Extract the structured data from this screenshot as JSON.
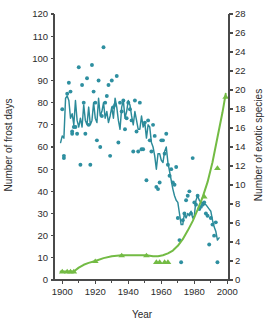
{
  "figure": {
    "background": "#ffffff",
    "width": 268,
    "height": 325
  },
  "axes": {
    "x": {
      "label": "Year",
      "min": 1895,
      "max": 2001,
      "major_ticks": [
        1900,
        1920,
        1940,
        1960,
        1980,
        2000
      ],
      "minor_ticks": [
        1910,
        1930,
        1950,
        1970,
        1990
      ],
      "ticklabels": [
        "1900",
        "1920",
        "1940",
        "1960",
        "1980",
        "2000"
      ]
    },
    "y_left": {
      "label": "Number of frost days",
      "min": 0,
      "max": 120,
      "ticks": [
        0,
        10,
        20,
        30,
        40,
        50,
        60,
        70,
        80,
        90,
        100,
        110,
        120
      ],
      "ticklabels": [
        "0",
        "10",
        "20",
        "30",
        "40",
        "50",
        "60",
        "70",
        "80",
        "90",
        "100",
        "110",
        "120"
      ],
      "color": "#2b2b2b"
    },
    "y_right": {
      "label": "Number of exotic species",
      "min": 0,
      "max": 28,
      "ticks": [
        0,
        2,
        4,
        6,
        8,
        10,
        12,
        14,
        16,
        18,
        20,
        22,
        24,
        26,
        28
      ],
      "ticklabels": [
        "0",
        "2",
        "4",
        "6",
        "8",
        "10",
        "12",
        "14",
        "16",
        "18",
        "20",
        "22",
        "24",
        "26",
        "28"
      ],
      "color": "#2b2b2b"
    }
  },
  "colors": {
    "frost": "#2b8a99",
    "frost_dot": "#2e8fa0",
    "exotic": "#73bb44",
    "axis": "#4a4a4a",
    "text": "#2b2b2b"
  },
  "chart_data": {
    "type": "line",
    "title": "",
    "xlabel": "Year",
    "ylabel": "Number of frost days",
    "y2label": "Number of exotic species",
    "xlim": [
      1895,
      2001
    ],
    "ylim": [
      0,
      120
    ],
    "y2lim": [
      0,
      28
    ],
    "grid": false,
    "legend": "none",
    "series": [
      {
        "name": "Annual number of frost days",
        "type": "scatter",
        "axis": "left",
        "color": "#2e8fa0",
        "marker": "circle",
        "points": [
          [
            1900,
            77
          ],
          [
            1901,
            56
          ],
          [
            1901,
            55
          ],
          [
            1903,
            84
          ],
          [
            1904,
            89
          ],
          [
            1905,
            85
          ],
          [
            1906,
            67
          ],
          [
            1906,
            66
          ],
          [
            1907,
            69
          ],
          [
            1908,
            69
          ],
          [
            1909,
            66
          ],
          [
            1910,
            96
          ],
          [
            1911,
            52
          ],
          [
            1912,
            88
          ],
          [
            1913,
            80
          ],
          [
            1914,
            66
          ],
          [
            1915,
            91
          ],
          [
            1916,
            70
          ],
          [
            1917,
            52
          ],
          [
            1918,
            97
          ],
          [
            1919,
            85
          ],
          [
            1920,
            80
          ],
          [
            1921,
            63
          ],
          [
            1922,
            90
          ],
          [
            1923,
            60
          ],
          [
            1924,
            74
          ],
          [
            1925,
            105
          ],
          [
            1926,
            80
          ],
          [
            1927,
            83
          ],
          [
            1928,
            88
          ],
          [
            1929,
            56
          ],
          [
            1930,
            90
          ],
          [
            1931,
            78
          ],
          [
            1932,
            79
          ],
          [
            1933,
            92
          ],
          [
            1934,
            62
          ],
          [
            1935,
            80
          ],
          [
            1936,
            76
          ],
          [
            1937,
            81
          ],
          [
            1938,
            68
          ],
          [
            1939,
            73
          ],
          [
            1940,
            80
          ],
          [
            1941,
            77
          ],
          [
            1942,
            72
          ],
          [
            1943,
            58
          ],
          [
            1944,
            81
          ],
          [
            1945,
            67
          ],
          [
            1946,
            58
          ],
          [
            1947,
            80
          ],
          [
            1948,
            59
          ],
          [
            1949,
            59
          ],
          [
            1950,
            71
          ],
          [
            1951,
            45
          ],
          [
            1952,
            72
          ],
          [
            1953,
            63
          ],
          [
            1954,
            58
          ],
          [
            1955,
            70
          ],
          [
            1956,
            65
          ],
          [
            1957,
            42
          ],
          [
            1958,
            41
          ],
          [
            1959,
            44
          ],
          [
            1960,
            63
          ],
          [
            1961,
            63
          ],
          [
            1962,
            57
          ],
          [
            1963,
            66
          ],
          [
            1964,
            52
          ],
          [
            1965,
            47
          ],
          [
            1966,
            50
          ],
          [
            1967,
            44
          ],
          [
            1968,
            43
          ],
          [
            1969,
            51
          ],
          [
            1970,
            28
          ],
          [
            1971,
            18
          ],
          [
            1972,
            8
          ],
          [
            1973,
            27
          ],
          [
            1974,
            30
          ],
          [
            1975,
            36
          ],
          [
            1976,
            38
          ],
          [
            1977,
            40
          ],
          [
            1978,
            30
          ],
          [
            1979,
            55
          ],
          [
            1980,
            35
          ],
          [
            1981,
            34
          ],
          [
            1982,
            38
          ],
          [
            1983,
            32
          ],
          [
            1984,
            33
          ],
          [
            1985,
            34
          ],
          [
            1986,
            35
          ],
          [
            1987,
            30
          ],
          [
            1988,
            29
          ],
          [
            1989,
            16
          ],
          [
            1990,
            28
          ],
          [
            1991,
            25
          ],
          [
            1992,
            20
          ],
          [
            1993,
            26
          ],
          [
            1994,
            8
          ]
        ]
      },
      {
        "name": "Frost days smoothed trend",
        "type": "line",
        "axis": "left",
        "color": "#2b8a99",
        "points": [
          [
            1899,
            62
          ],
          [
            1900,
            65
          ],
          [
            1901,
            64
          ],
          [
            1902,
            82
          ],
          [
            1903,
            83
          ],
          [
            1904,
            81
          ],
          [
            1905,
            73
          ],
          [
            1906,
            75
          ],
          [
            1907,
            70
          ],
          [
            1908,
            81
          ],
          [
            1909,
            72
          ],
          [
            1910,
            69
          ],
          [
            1911,
            73
          ],
          [
            1912,
            69
          ],
          [
            1913,
            79
          ],
          [
            1914,
            72
          ],
          [
            1915,
            70
          ],
          [
            1916,
            78
          ],
          [
            1917,
            70
          ],
          [
            1918,
            72
          ],
          [
            1919,
            80
          ],
          [
            1920,
            73
          ],
          [
            1921,
            71
          ],
          [
            1922,
            82
          ],
          [
            1923,
            74
          ],
          [
            1924,
            76
          ],
          [
            1925,
            80
          ],
          [
            1926,
            73
          ],
          [
            1927,
            76
          ],
          [
            1928,
            71
          ],
          [
            1929,
            74
          ],
          [
            1930,
            78
          ],
          [
            1931,
            73
          ],
          [
            1932,
            82
          ],
          [
            1933,
            78
          ],
          [
            1934,
            72
          ],
          [
            1935,
            68
          ],
          [
            1936,
            78
          ],
          [
            1937,
            81
          ],
          [
            1938,
            73
          ],
          [
            1939,
            76
          ],
          [
            1940,
            81
          ],
          [
            1941,
            79
          ],
          [
            1942,
            74
          ],
          [
            1943,
            70
          ],
          [
            1944,
            76
          ],
          [
            1945,
            72
          ],
          [
            1946,
            68
          ],
          [
            1947,
            68
          ],
          [
            1948,
            74
          ],
          [
            1949,
            69
          ],
          [
            1950,
            71
          ],
          [
            1951,
            64
          ],
          [
            1952,
            70
          ],
          [
            1953,
            69
          ],
          [
            1954,
            62
          ],
          [
            1955,
            60
          ],
          [
            1956,
            56
          ],
          [
            1957,
            50
          ],
          [
            1958,
            57
          ],
          [
            1959,
            57
          ],
          [
            1960,
            54
          ],
          [
            1961,
            53
          ],
          [
            1962,
            58
          ],
          [
            1963,
            60
          ],
          [
            1964,
            53
          ],
          [
            1965,
            49
          ],
          [
            1966,
            45
          ],
          [
            1967,
            41
          ],
          [
            1968,
            38
          ],
          [
            1969,
            36
          ],
          [
            1970,
            35
          ],
          [
            1971,
            30
          ],
          [
            1972,
            25
          ],
          [
            1973,
            25
          ],
          [
            1974,
            30
          ],
          [
            1975,
            28
          ],
          [
            1976,
            30
          ],
          [
            1977,
            29
          ],
          [
            1978,
            31
          ],
          [
            1979,
            28
          ],
          [
            1980,
            29
          ],
          [
            1981,
            36
          ],
          [
            1982,
            38
          ],
          [
            1983,
            36
          ],
          [
            1984,
            35
          ],
          [
            1985,
            35
          ],
          [
            1986,
            34
          ],
          [
            1987,
            34
          ],
          [
            1988,
            33
          ],
          [
            1989,
            32
          ],
          [
            1990,
            31
          ],
          [
            1991,
            27
          ],
          [
            1992,
            24
          ],
          [
            1993,
            22
          ],
          [
            1994,
            18
          ],
          [
            1995,
            19
          ]
        ]
      },
      {
        "name": "Cumulative exotic species",
        "type": "line",
        "axis": "right",
        "color": "#73bb44",
        "points": [
          [
            1899,
            0.9
          ],
          [
            1901,
            0.9
          ],
          [
            1903,
            0.9
          ],
          [
            1905,
            0.9
          ],
          [
            1907,
            0.9
          ],
          [
            1910,
            1.3
          ],
          [
            1913,
            1.6
          ],
          [
            1916,
            1.8
          ],
          [
            1920,
            2.0
          ],
          [
            1925,
            2.3
          ],
          [
            1930,
            2.5
          ],
          [
            1936,
            2.6
          ],
          [
            1942,
            2.6
          ],
          [
            1948,
            2.6
          ],
          [
            1951,
            2.6
          ],
          [
            1955,
            2.5
          ],
          [
            1958,
            2.5
          ],
          [
            1961,
            2.6
          ],
          [
            1964,
            2.8
          ],
          [
            1967,
            3.1
          ],
          [
            1970,
            3.6
          ],
          [
            1973,
            4.3
          ],
          [
            1976,
            5.2
          ],
          [
            1979,
            6.2
          ],
          [
            1982,
            7.4
          ],
          [
            1985,
            8.7
          ],
          [
            1988,
            10.3
          ],
          [
            1991,
            12.4
          ],
          [
            1994,
            15.0
          ],
          [
            1997,
            17.6
          ],
          [
            1999,
            19.6
          ]
        ]
      },
      {
        "name": "Exotic species observations",
        "type": "scatter",
        "axis": "right",
        "color": "#73bb44",
        "marker": "triangle",
        "points": [
          [
            1900,
            0.9
          ],
          [
            1903,
            0.9
          ],
          [
            1905,
            0.9
          ],
          [
            1907,
            0.9
          ],
          [
            1920,
            2.0
          ],
          [
            1936,
            2.6
          ],
          [
            1951,
            2.6
          ],
          [
            1957,
            1.9
          ],
          [
            1959,
            1.9
          ],
          [
            1962,
            1.9
          ],
          [
            1964,
            1.9
          ],
          [
            1986,
            8.8
          ],
          [
            1994,
            11.8
          ],
          [
            1999,
            19.3
          ]
        ]
      }
    ]
  }
}
